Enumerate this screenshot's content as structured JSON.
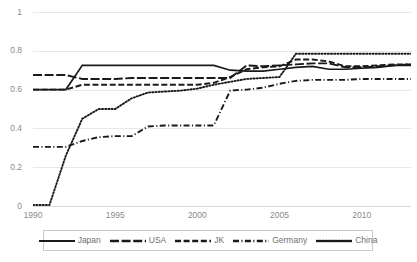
{
  "chart_data": {
    "type": "line",
    "title": "",
    "xlabel": "",
    "ylabel": "",
    "xlim": [
      1990,
      2013
    ],
    "ylim": [
      0,
      1
    ],
    "grid": true,
    "legend_position": "bottom",
    "x_ticks": [
      "1990",
      "1995",
      "2000",
      "2005",
      "2010"
    ],
    "x_tick_values": [
      1990,
      1995,
      2000,
      2005,
      2010
    ],
    "y_ticks": [
      "0",
      "0.2",
      "0.4",
      "0.6",
      "0.8",
      "1"
    ],
    "y_tick_values": [
      0,
      0.2,
      0.4,
      0.6,
      0.8,
      1
    ],
    "x": [
      1990,
      1991,
      1992,
      1993,
      1994,
      1995,
      1996,
      1997,
      1998,
      1999,
      2000,
      2001,
      2002,
      2003,
      2004,
      2005,
      2006,
      2007,
      2008,
      2009,
      2010,
      2011,
      2012,
      2013
    ],
    "series": [
      {
        "name": "Japan",
        "style": "solid",
        "color": "#1a1a1a",
        "values": [
          0.6,
          0.6,
          0.6,
          0.725,
          0.725,
          0.725,
          0.725,
          0.725,
          0.725,
          0.725,
          0.725,
          0.725,
          0.7,
          0.695,
          0.695,
          0.705,
          0.715,
          0.72,
          0.705,
          0.705,
          0.71,
          0.715,
          0.725,
          0.725
        ]
      },
      {
        "name": "USA",
        "style": "long-dash",
        "color": "#1a1a1a",
        "values": [
          0.675,
          0.675,
          0.675,
          0.655,
          0.655,
          0.655,
          0.66,
          0.66,
          0.66,
          0.66,
          0.66,
          0.66,
          0.66,
          0.725,
          0.72,
          0.725,
          0.73,
          0.735,
          0.735,
          0.715,
          0.715,
          0.72,
          0.725,
          0.73
        ]
      },
      {
        "name": "JK",
        "style": "dash",
        "color": "#1a1a1a",
        "values": [
          0.6,
          0.6,
          0.6,
          0.625,
          0.625,
          0.625,
          0.625,
          0.625,
          0.625,
          0.625,
          0.625,
          0.635,
          0.665,
          0.705,
          0.715,
          0.72,
          0.755,
          0.755,
          0.745,
          0.72,
          0.72,
          0.725,
          0.73,
          0.73
        ]
      },
      {
        "name": "Germany",
        "style": "dash-dot",
        "color": "#1a1a1a",
        "values": [
          0.305,
          0.305,
          0.305,
          0.335,
          0.355,
          0.36,
          0.36,
          0.41,
          0.415,
          0.415,
          0.415,
          0.415,
          0.595,
          0.6,
          0.61,
          0.63,
          0.645,
          0.65,
          0.65,
          0.65,
          0.655,
          0.655,
          0.655,
          0.655
        ]
      },
      {
        "name": "China",
        "style": "dot",
        "color": "#1a1a1a",
        "values": [
          0.005,
          0.005,
          0.26,
          0.45,
          0.5,
          0.5,
          0.555,
          0.585,
          0.59,
          0.595,
          0.605,
          0.625,
          0.64,
          0.655,
          0.66,
          0.665,
          0.785,
          0.785,
          0.785,
          0.785,
          0.785,
          0.785,
          0.785,
          0.785
        ]
      }
    ]
  },
  "legend": {
    "items": [
      {
        "label": "Japan",
        "style": "solid"
      },
      {
        "label": "USA",
        "style": "long-dash"
      },
      {
        "label": "JK",
        "style": "dash"
      },
      {
        "label": "Germany",
        "style": "dash-dot"
      },
      {
        "label": "China",
        "style": "dot"
      }
    ]
  }
}
